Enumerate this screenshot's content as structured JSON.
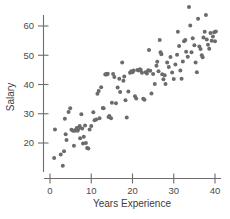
{
  "chart_data": {
    "type": "scatter",
    "title": "",
    "xlabel": "Years Experience",
    "ylabel": "Salary",
    "xlim": [
      -1.5,
      41.5
    ],
    "ylim": [
      10,
      68
    ],
    "grid": false,
    "legend": null,
    "xticks": [
      0,
      10,
      20,
      30,
      40
    ],
    "yticks": [
      20,
      30,
      40,
      50,
      60
    ],
    "xtick_labels": [
      "0",
      "10",
      "20",
      "30",
      "40"
    ],
    "ytick_labels": [
      "20",
      "30",
      "40",
      "50",
      "60"
    ],
    "marker": "filled-circle",
    "marker_color": "#6b6b6b",
    "marker_size": 2.0,
    "n_points": 131,
    "points": [
      [
        1.0,
        14.9
      ],
      [
        1.2,
        24.6
      ],
      [
        2.6,
        16.1
      ],
      [
        3.1,
        12.2
      ],
      [
        3.4,
        17.2
      ],
      [
        3.6,
        28.3
      ],
      [
        3.8,
        23.0
      ],
      [
        4.0,
        21.0
      ],
      [
        4.5,
        30.6
      ],
      [
        4.9,
        31.9
      ],
      [
        5.2,
        24.5
      ],
      [
        5.6,
        24.2
      ],
      [
        5.8,
        19.1
      ],
      [
        6.0,
        24.2
      ],
      [
        6.3,
        24.6
      ],
      [
        6.5,
        25.1
      ],
      [
        6.7,
        24.2
      ],
      [
        6.9,
        24.8
      ],
      [
        7.0,
        25.3
      ],
      [
        7.2,
        25.8
      ],
      [
        7.3,
        21.6
      ],
      [
        7.6,
        29.8
      ],
      [
        7.8,
        25.0
      ],
      [
        8.0,
        19.8
      ],
      [
        8.2,
        22.1
      ],
      [
        8.5,
        26.0
      ],
      [
        8.7,
        20.0
      ],
      [
        9.0,
        18.3
      ],
      [
        9.3,
        18.1
      ],
      [
        9.6,
        24.6
      ],
      [
        10.0,
        25.8
      ],
      [
        10.5,
        30.5
      ],
      [
        10.8,
        27.8
      ],
      [
        11.2,
        28.0
      ],
      [
        11.5,
        36.8
      ],
      [
        11.8,
        37.8
      ],
      [
        12.0,
        28.5
      ],
      [
        12.4,
        39.1
      ],
      [
        12.8,
        32.0
      ],
      [
        13.0,
        31.9
      ],
      [
        13.4,
        43.4
      ],
      [
        13.6,
        43.6
      ],
      [
        13.8,
        43.4
      ],
      [
        14.0,
        43.7
      ],
      [
        14.2,
        28.9
      ],
      [
        14.4,
        29.2
      ],
      [
        14.8,
        28.5
      ],
      [
        15.0,
        33.8
      ],
      [
        15.3,
        43.6
      ],
      [
        15.6,
        42.6
      ],
      [
        16.0,
        33.6
      ],
      [
        16.4,
        39.0
      ],
      [
        16.8,
        42.0
      ],
      [
        17.0,
        37.4
      ],
      [
        17.5,
        47.5
      ],
      [
        17.8,
        41.3
      ],
      [
        18.0,
        42.7
      ],
      [
        18.3,
        34.6
      ],
      [
        18.6,
        28.7
      ],
      [
        19.0,
        37.6
      ],
      [
        19.4,
        44.0
      ],
      [
        19.7,
        44.5
      ],
      [
        20.0,
        44.2
      ],
      [
        20.3,
        44.8
      ],
      [
        20.6,
        36.0
      ],
      [
        20.9,
        35.2
      ],
      [
        21.2,
        45.0
      ],
      [
        21.5,
        44.8
      ],
      [
        21.8,
        45.2
      ],
      [
        22.0,
        45.0
      ],
      [
        22.3,
        44.0
      ],
      [
        22.6,
        35.1
      ],
      [
        22.9,
        34.8
      ],
      [
        23.2,
        44.2
      ],
      [
        23.5,
        43.8
      ],
      [
        23.8,
        44.9
      ],
      [
        24.0,
        51.8
      ],
      [
        24.3,
        44.7
      ],
      [
        24.6,
        36.9
      ],
      [
        25.0,
        43.6
      ],
      [
        25.4,
        40.2
      ],
      [
        25.8,
        46.4
      ],
      [
        26.0,
        47.8
      ],
      [
        26.3,
        44.5
      ],
      [
        26.6,
        55.2
      ],
      [
        26.8,
        51.0
      ],
      [
        27.0,
        50.3
      ],
      [
        27.2,
        43.5
      ],
      [
        27.5,
        41.8
      ],
      [
        27.8,
        43.2
      ],
      [
        28.0,
        40.2
      ],
      [
        28.4,
        47.5
      ],
      [
        28.8,
        46.0
      ],
      [
        29.2,
        49.4
      ],
      [
        29.6,
        44.1
      ],
      [
        30.0,
        41.9
      ],
      [
        30.4,
        46.8
      ],
      [
        30.8,
        50.2
      ],
      [
        31.0,
        58.0
      ],
      [
        31.3,
        53.2
      ],
      [
        31.6,
        44.8
      ],
      [
        31.9,
        42.0
      ],
      [
        32.2,
        47.9
      ],
      [
        32.5,
        54.8
      ],
      [
        32.8,
        55.2
      ],
      [
        33.0,
        51.2
      ],
      [
        33.4,
        49.5
      ],
      [
        33.7,
        66.5
      ],
      [
        34.0,
        60.2
      ],
      [
        34.3,
        51.0
      ],
      [
        34.6,
        55.8
      ],
      [
        35.0,
        53.4
      ],
      [
        35.3,
        47.5
      ],
      [
        35.6,
        44.2
      ],
      [
        35.9,
        62.5
      ],
      [
        36.2,
        53.0
      ],
      [
        36.5,
        52.1
      ],
      [
        36.8,
        50.0
      ],
      [
        37.0,
        49.3
      ],
      [
        37.2,
        56.1
      ],
      [
        37.5,
        58.0
      ],
      [
        37.8,
        63.8
      ],
      [
        38.0,
        55.4
      ],
      [
        38.3,
        53.6
      ],
      [
        38.6,
        52.2
      ],
      [
        38.9,
        57.6
      ],
      [
        39.2,
        55.0
      ],
      [
        39.5,
        56.4
      ],
      [
        39.8,
        57.9
      ],
      [
        40.0,
        54.8
      ],
      [
        40.2,
        58.1
      ]
    ]
  }
}
